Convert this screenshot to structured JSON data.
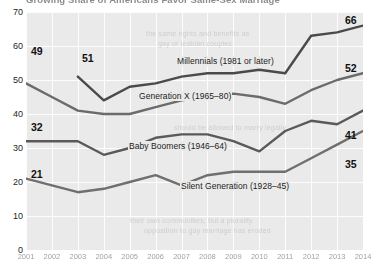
{
  "chart_data": {
    "type": "line",
    "title": "Growing Share of Americans Favor Same-Sex Marriage",
    "xlabel": "",
    "ylabel": "",
    "ylim": [
      0,
      70
    ],
    "yticks": [
      0,
      10,
      20,
      30,
      40,
      50,
      60,
      70
    ],
    "grid": true,
    "legend_position": "inline-on-lines",
    "x": [
      2001,
      2002,
      2003,
      2004,
      2005,
      2006,
      2007,
      2008,
      2009,
      2010,
      2011,
      2012,
      2013,
      2014
    ],
    "xtick_labels": [
      "2001",
      "2002",
      "2003",
      "2004",
      "2005",
      "2006",
      "2007",
      "2008",
      "2009",
      "2010",
      "2011",
      "2012",
      "2013",
      "2014"
    ],
    "series": [
      {
        "name": "Millennials (1981 or later)",
        "label": "Millennials (1981 or later)",
        "start_value": 51,
        "end_value": 66,
        "values": [
          null,
          null,
          51,
          44,
          48,
          49,
          51,
          52,
          52,
          53,
          52,
          63,
          64,
          66
        ]
      },
      {
        "name": "Generation X (1965–80)",
        "label": "Generation X (1965–80)",
        "start_value": 49,
        "end_value": 52,
        "values": [
          49,
          45,
          41,
          40,
          40,
          42,
          44,
          45,
          46,
          45,
          43,
          47,
          50,
          52
        ]
      },
      {
        "name": "Baby Boomers (1946–64)",
        "label": "Baby Boomers (1946–64)",
        "start_value": 32,
        "end_value": 41,
        "values": [
          32,
          32,
          32,
          28,
          30,
          33,
          34,
          34,
          32,
          29,
          35,
          38,
          37,
          41
        ]
      },
      {
        "name": "Silent Generation (1928–45)",
        "label": "Silent Generation (1928–45)",
        "start_value": 21,
        "end_value": 35,
        "values": [
          21,
          19,
          17,
          18,
          20,
          22,
          19,
          22,
          23,
          23,
          23,
          27,
          31,
          35
        ]
      }
    ]
  },
  "value_callouts": {
    "millennials_start": "51",
    "millennials_end": "66",
    "genx_start": "49",
    "genx_end": "52",
    "boomers_start": "32",
    "boomers_end": "41",
    "silent_start": "21",
    "silent_end": "35"
  },
  "y_axis": {
    "ticks": [
      "70",
      "60",
      "50",
      "40",
      "30",
      "20",
      "10",
      "0"
    ]
  },
  "x_axis": {
    "ticks": [
      "2001",
      "2002",
      "2003",
      "2004",
      "2005",
      "2006",
      "2007",
      "2008",
      "2009",
      "2010",
      "2011",
      "2012",
      "2013",
      "2014"
    ]
  },
  "bleed_through": {
    "line1": "the same rights and benefits as",
    "line2": "gay or lesbian couples",
    "line3": "should be allowed to marry legally",
    "line4": "their own communities, but a plurality",
    "line5": "opposition to gay marriage has eroded"
  },
  "colors": {
    "plot_background": "#eaeaea",
    "gridline": "#fdfdfd",
    "millennials_line": "#4a4a4a",
    "genx_line": "#6b6b6b",
    "boomers_line": "#5a5a5a",
    "silent_line": "#6f6f6f",
    "text": "#1a1a1a",
    "page_background": "#ffffff"
  }
}
